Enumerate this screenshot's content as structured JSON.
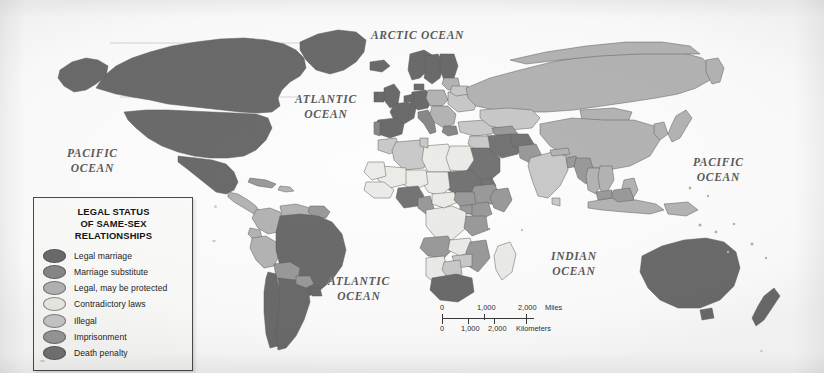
{
  "figure": {
    "kind": "world-choropleth-map",
    "width": 824,
    "height": 373
  },
  "legend": {
    "title": "LEGAL STATUS\nOF SAME-SEX\nRELATIONSHIPS",
    "items": [
      {
        "label": "Legal marriage",
        "color": "#6b6b6b"
      },
      {
        "label": "Marriage substitute",
        "color": "#888888"
      },
      {
        "label": "Legal, may be protected",
        "color": "#b4b4b4"
      },
      {
        "label": "Contradictory laws",
        "color": "#ebebe7"
      },
      {
        "label": "Illegal",
        "color": "#c9c9c9"
      },
      {
        "label": "Imprisonment",
        "color": "#9a9a9a"
      },
      {
        "label": "Death penalty",
        "color": "#747474"
      }
    ]
  },
  "ocean_labels": [
    {
      "name": "arctic-ocean",
      "text": "ARCTIC OCEAN",
      "x": 371,
      "y": 28,
      "font_size": 11.5
    },
    {
      "name": "atlantic-ocean-north",
      "text": "ATLANTIC\nOCEAN",
      "x": 295,
      "y": 92,
      "font_size": 11.5
    },
    {
      "name": "pacific-ocean-west",
      "text": "PACIFIC\nOCEAN",
      "x": 67,
      "y": 146,
      "font_size": 11.5
    },
    {
      "name": "pacific-ocean-east",
      "text": "PACIFIC\nOCEAN",
      "x": 693,
      "y": 155,
      "font_size": 11.5
    },
    {
      "name": "indian-ocean",
      "text": "INDIAN\nOCEAN",
      "x": 551,
      "y": 249,
      "font_size": 11.5
    },
    {
      "name": "atlantic-ocean-south",
      "text": "ATLANTIC\nOCEAN",
      "x": 328,
      "y": 274,
      "font_size": 11.5
    }
  ],
  "scale_bar": {
    "miles": {
      "unit_label": "Miles",
      "ticks": [
        "0",
        "1,000",
        "2,000"
      ]
    },
    "kilometers": {
      "unit_label": "Kilometers",
      "ticks": [
        "0",
        "1,000",
        "2,000"
      ]
    }
  },
  "palette": {
    "legal_marriage": "#6b6b6b",
    "marriage_substitute": "#888888",
    "legal_may_be_protected": "#b4b4b4",
    "contradictory_laws": "#ebebe7",
    "illegal": "#c9c9c9",
    "imprisonment": "#9a9a9a",
    "death_penalty": "#747474",
    "ocean": "#fdfdfd",
    "border": "#5e5e5e",
    "graticule": "#a8a8a8",
    "label_text": "#5a5a5a"
  }
}
